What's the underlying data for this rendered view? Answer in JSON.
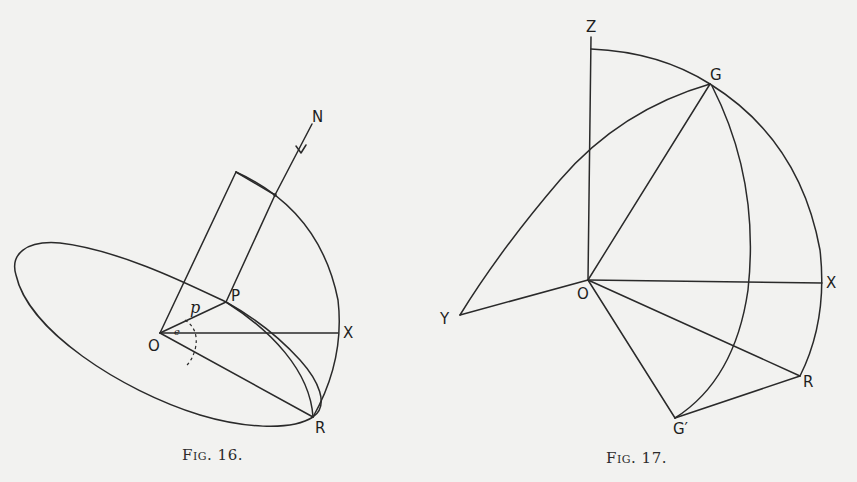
{
  "figures": [
    {
      "id": "fig16",
      "caption": "Fig. 16.",
      "caption_prefix": "Fig.",
      "caption_number": "16.",
      "labels": {
        "N": "N",
        "P": "P",
        "O": "O",
        "X": "X",
        "R": "R",
        "p": "p",
        "e": "e"
      }
    },
    {
      "id": "fig17",
      "caption": "Fig. 17.",
      "caption_prefix": "Fig.",
      "caption_number": "17.",
      "labels": {
        "Z": "Z",
        "G": "G",
        "O": "O",
        "X": "X",
        "Y": "Y",
        "R": "R",
        "G_prime": "G′"
      }
    }
  ],
  "colors": {
    "ink": "#2a2a2a",
    "paper": "#f2f2f0"
  }
}
